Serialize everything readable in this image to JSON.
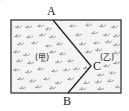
{
  "diagram": {
    "type": "geometry-field-with-fold-line",
    "points": {
      "A": {
        "label": "A",
        "x": 53,
        "y": 20
      },
      "B": {
        "label": "B",
        "x": 68,
        "y": 93
      },
      "C": {
        "label": "C",
        "x": 91,
        "y": 66
      }
    },
    "regions": [
      {
        "label": "(甲)"
      },
      {
        "label": "(乙)"
      }
    ],
    "border_color": "#333333",
    "fill_color": "#f4f4f4",
    "grass_color": "#8a8a8a"
  }
}
